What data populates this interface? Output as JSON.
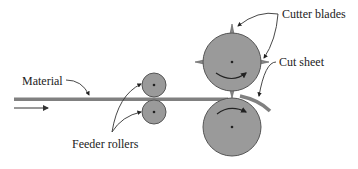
{
  "diagram": {
    "labels": {
      "material": "Material",
      "feeder_rollers": "Feeder rollers",
      "cutter_blades": "Cutter blades",
      "cut_sheet": "Cut sheet"
    },
    "colors": {
      "roller_fill": "#9a9a9a",
      "roller_stroke": "#555555",
      "material": "#808080",
      "leader_line": "#333333",
      "text": "#222222"
    },
    "components": [
      {
        "name": "material-strip",
        "label": "Material"
      },
      {
        "name": "feeder-roller-top",
        "label": "Feeder rollers"
      },
      {
        "name": "feeder-roller-bottom",
        "label": "Feeder rollers"
      },
      {
        "name": "cutter-roller-top",
        "label": "Cutter blades"
      },
      {
        "name": "cutter-roller-bottom",
        "label": ""
      },
      {
        "name": "cut-sheet",
        "label": "Cut sheet"
      }
    ]
  }
}
